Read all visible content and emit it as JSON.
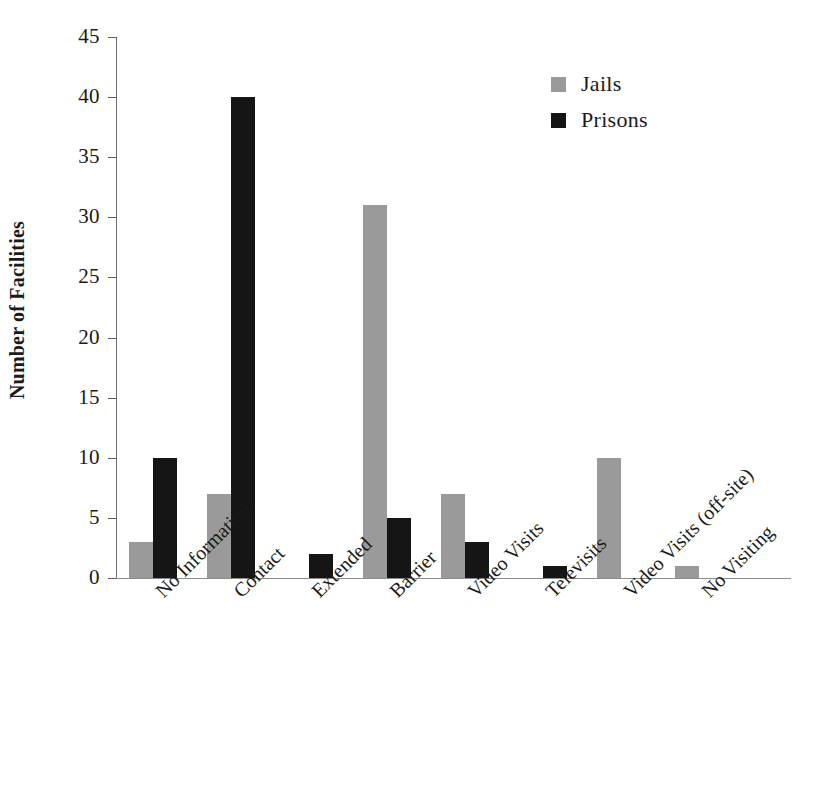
{
  "chart_data": {
    "type": "bar",
    "title": "",
    "xlabel": "",
    "ylabel": "Number of Facilities",
    "ylim": [
      0,
      45
    ],
    "ytick_step": 5,
    "yticks": [
      45,
      40,
      35,
      30,
      25,
      20,
      15,
      10,
      5,
      0
    ],
    "grid": false,
    "legend_position": "top-right",
    "categories": [
      "No Information",
      "Contact",
      "Extended",
      "Barrier",
      "Video Visits",
      "Televisits",
      "Video Visits (off-site)",
      "No Visiting"
    ],
    "series": [
      {
        "name": "Jails",
        "color": "#9a9a9a",
        "values": [
          3,
          7,
          0,
          31,
          7,
          0,
          10,
          1
        ]
      },
      {
        "name": "Prisons",
        "color": "#151515",
        "values": [
          10,
          40,
          2,
          5,
          3,
          1,
          0,
          0
        ]
      }
    ]
  },
  "axes": {
    "y_title": "Number of Facilities",
    "y_tick_labels": [
      "45",
      "40",
      "35",
      "30",
      "25",
      "20",
      "15",
      "10",
      "5",
      "0"
    ]
  },
  "legend": {
    "items": [
      {
        "label": "Jails",
        "color": "#9a9a9a"
      },
      {
        "label": "Prisons",
        "color": "#151515"
      }
    ]
  },
  "caption": {
    "text": ""
  }
}
